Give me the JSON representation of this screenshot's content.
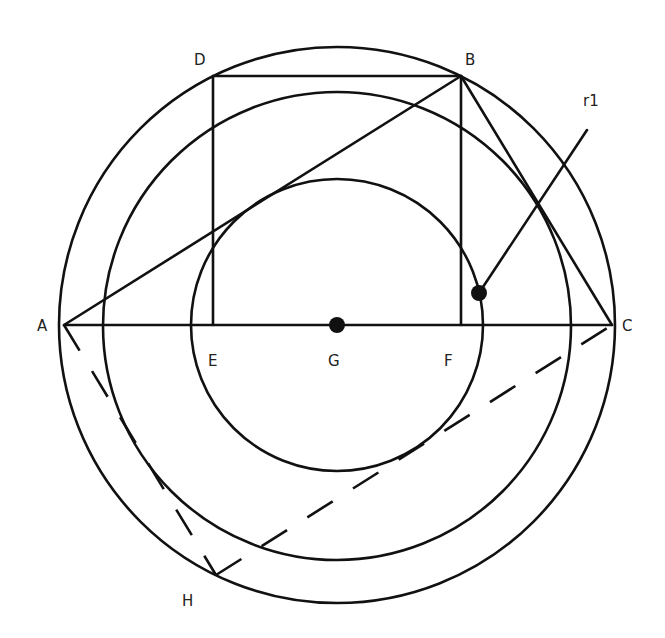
{
  "diagram": {
    "type": "geometry-construction",
    "colors": {
      "stroke": "#111111",
      "label": "#222222",
      "background": "#ffffff"
    },
    "points": {
      "A": {
        "label": "A",
        "x": 64,
        "y": 325
      },
      "B": {
        "label": "B",
        "x": 461,
        "y": 76
      },
      "C": {
        "label": "C",
        "x": 612,
        "y": 325
      },
      "D": {
        "label": "D",
        "x": 213,
        "y": 76
      },
      "E": {
        "label": "E",
        "x": 213,
        "y": 325
      },
      "F": {
        "label": "F",
        "x": 461,
        "y": 325
      },
      "G": {
        "label": "G",
        "x": 337,
        "y": 325
      },
      "H": {
        "label": "H",
        "x": 216,
        "y": 575
      }
    },
    "circles": [
      {
        "name": "outer",
        "cx": 337,
        "cy": 325,
        "r": 278
      },
      {
        "name": "middle",
        "cx": 337,
        "cy": 326,
        "r": 234
      },
      {
        "name": "inner",
        "cx": 337,
        "cy": 325,
        "r": 146
      }
    ],
    "annotation": {
      "label": "r1",
      "from": [
        479,
        293
      ],
      "to": [
        587,
        130
      ]
    },
    "segments": [
      "AC",
      "AB",
      "BC",
      "DB",
      "DE",
      "BF"
    ],
    "dashed_segments": [
      "AH",
      "HC"
    ],
    "labels": {
      "A": "A",
      "B": "B",
      "C": "C",
      "D": "D",
      "E": "E",
      "F": "F",
      "G": "G",
      "H": "H",
      "r1": "r1"
    }
  }
}
